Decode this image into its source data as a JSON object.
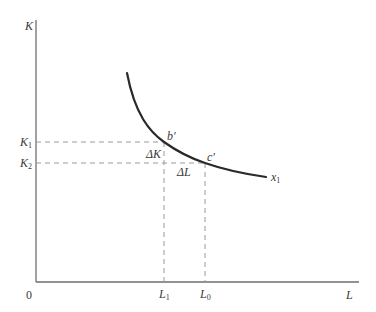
{
  "diagram": {
    "type": "isoquant",
    "axes": {
      "x_label": "L",
      "y_label": "K",
      "origin_label": "0"
    },
    "curve": {
      "label_base": "x",
      "label_sub": "1",
      "color": "#2a2a2a"
    },
    "points": {
      "b": "b′",
      "c": "c′"
    },
    "y_ticks": [
      {
        "base": "K",
        "sub": "1"
      },
      {
        "base": "K",
        "sub": "2"
      }
    ],
    "x_ticks": [
      {
        "base": "L",
        "sub": "1"
      },
      {
        "base": "L",
        "sub": "0"
      }
    ],
    "deltas": {
      "delta_k": "ΔK",
      "delta_l": "ΔL"
    },
    "colors": {
      "axis": "#6e6e6e",
      "dashed": "#9a9a9a",
      "text": "#3a3a3a"
    }
  }
}
